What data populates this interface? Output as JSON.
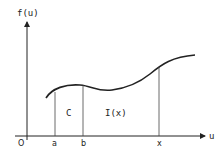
{
  "diagram": {
    "y_axis_label": "f(u)",
    "x_axis_label": "u",
    "origin_label": "O",
    "tick_labels": [
      "a",
      "b",
      "x"
    ],
    "region_labels": {
      "constant": "C",
      "integral": "I(x)"
    },
    "colors": {
      "line": "#222222",
      "background": "#ffffff"
    }
  }
}
